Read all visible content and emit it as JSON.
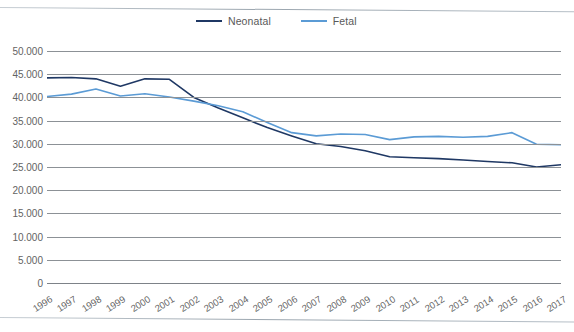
{
  "legend": {
    "position": "top-center",
    "entries": [
      {
        "label": "Neonatal",
        "color": "#1f3864",
        "icon": "line-swatch-icon"
      },
      {
        "label": "Fetal",
        "color": "#5b9bd5",
        "icon": "line-swatch-icon"
      }
    ]
  },
  "chart_data": {
    "type": "line",
    "title": "",
    "subtitle": "",
    "xlabel": "",
    "ylabel": "",
    "grid": true,
    "legend_position": "top-center",
    "number_format": "European (period thousands separator)",
    "categories": [
      "1996",
      "1997",
      "1998",
      "1999",
      "2000",
      "2001",
      "2002",
      "2003",
      "2004",
      "2005",
      "2006",
      "2007",
      "2008",
      "2009",
      "2010",
      "2011",
      "2012",
      "2013",
      "2014",
      "2015",
      "2016",
      "2017"
    ],
    "x": [
      1996,
      1997,
      1998,
      1999,
      2000,
      2001,
      2002,
      2003,
      2004,
      2005,
      2006,
      2007,
      2008,
      2009,
      2010,
      2011,
      2012,
      2013,
      2014,
      2015,
      2016,
      2017
    ],
    "xlim": [
      1996,
      2017
    ],
    "ylim": [
      0,
      50000
    ],
    "yticks": [
      0,
      5000,
      10000,
      15000,
      20000,
      25000,
      30000,
      35000,
      40000,
      45000,
      50000
    ],
    "ytick_labels": [
      "0",
      "5.000",
      "10.000",
      "15.000",
      "20.000",
      "25.000",
      "30.000",
      "35.000",
      "40.000",
      "45.000",
      "50.000"
    ],
    "series": [
      {
        "name": "Neonatal",
        "color": "#1f3864",
        "values": [
          44200,
          44300,
          44000,
          42400,
          44000,
          43900,
          40000,
          37700,
          35600,
          33500,
          31700,
          30000,
          29400,
          28500,
          27200,
          27000,
          26800,
          26500,
          26200,
          25900,
          25000,
          25500
        ]
      },
      {
        "name": "Fetal",
        "color": "#5b9bd5",
        "values": [
          40200,
          40700,
          41800,
          40300,
          40800,
          40100,
          39200,
          38200,
          36900,
          34600,
          32400,
          31700,
          32100,
          32000,
          30900,
          31500,
          31600,
          31400,
          31600,
          32400,
          29900,
          29800
        ]
      }
    ]
  },
  "axes": {
    "y_tick_labels": [
      "50.000",
      "45.000",
      "40.000",
      "35.000",
      "30.000",
      "25.000",
      "20.000",
      "15.000",
      "10.000",
      "5.000",
      "0"
    ],
    "x_tick_labels": [
      "1996",
      "1997",
      "1998",
      "1999",
      "2000",
      "2001",
      "2002",
      "2003",
      "2004",
      "2005",
      "2006",
      "2007",
      "2008",
      "2009",
      "2010",
      "2011",
      "2012",
      "2013",
      "2014",
      "2015",
      "2016",
      "2017"
    ]
  }
}
